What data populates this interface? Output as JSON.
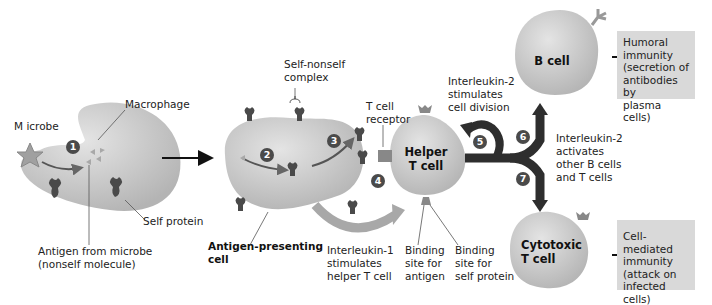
{
  "diagram": {
    "type": "immune-response-flow",
    "steps": [
      "1",
      "2",
      "3",
      "4",
      "5",
      "6",
      "7"
    ],
    "labels": {
      "microbe": "M icrobe",
      "macrophage": "Macrophage",
      "self_protein": "Self protein",
      "antigen_line1": "Antigen from microbe",
      "antigen_line2": "(nonself molecule)",
      "self_nonself_line1": "Self-nonself",
      "self_nonself_line2": "complex",
      "tcr_line1": "T cell",
      "tcr_line2": "receptor",
      "apc_line1": "Antigen-presenting",
      "apc_line2": "cell",
      "il1_line1": "Interleukin-1",
      "il1_line2": "stimulates",
      "il1_line3": "helper T cell",
      "bind_antigen_line1": "Binding",
      "bind_antigen_line2": "site for",
      "bind_antigen_line3": "antigen",
      "bind_self_line1": "Binding",
      "bind_self_line2": "site for",
      "bind_self_line3": "self protein",
      "il2_div_line1": "Interleukin-2",
      "il2_div_line2": "stimulates",
      "il2_div_line3": "cell division",
      "il2_act_line1": "Interleukin-2",
      "il2_act_line2": "activates",
      "il2_act_line3": "other B cells",
      "il2_act_line4": "and T cells"
    },
    "cells": {
      "helper_line1": "Helper",
      "helper_line2": "T cell",
      "b_cell": "B cell",
      "cytotoxic_line1": "Cytotoxic",
      "cytotoxic_line2": "T cell"
    },
    "outcomes": {
      "humoral": [
        "Humoral",
        "immunity",
        "(secretion of",
        "antibodies by",
        "plasma cells)"
      ],
      "cell_mediated": [
        "Cell-mediated",
        "immunity",
        "(attack on",
        "infected cells)"
      ]
    },
    "colors": {
      "cell_fill": "#c8c8c8",
      "protein": "#4a4a4a",
      "arrow_dark": "#2e2e2e",
      "arrow_gray": "#a8a8a8",
      "outcome_box": "#d9d9d9"
    }
  }
}
